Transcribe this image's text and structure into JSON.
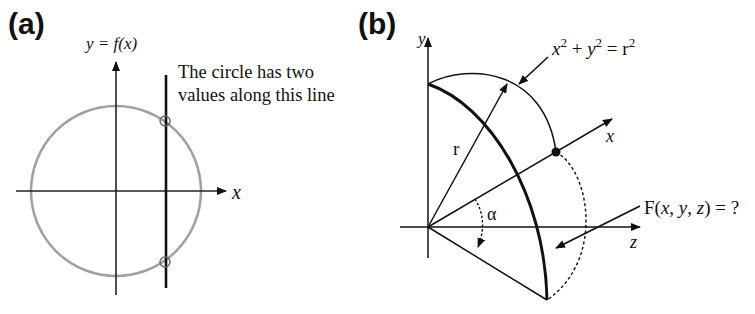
{
  "panel_a": {
    "label": "(a)",
    "y_axis_label": "y = f(x)",
    "x_axis_label": "x",
    "annotation_line1": "The circle has two",
    "annotation_line2": "values along this line",
    "circle_color": "#a0a0a0"
  },
  "panel_b": {
    "label": "(b)",
    "y_axis_label": "y",
    "x_axis_label": "x",
    "z_axis_label": "z",
    "radius_label": "r",
    "angle_label": "α",
    "equation": {
      "x": "x",
      "sup1": "2",
      "plus": " + ",
      "y": "y",
      "sup2": "2",
      "eq": " = r",
      "sup3": "2"
    },
    "function_label": {
      "F": "F(",
      "x": "x",
      "c1": ", ",
      "y": "y",
      "c2": ", ",
      "z": "z",
      "end": ") = ?"
    }
  }
}
